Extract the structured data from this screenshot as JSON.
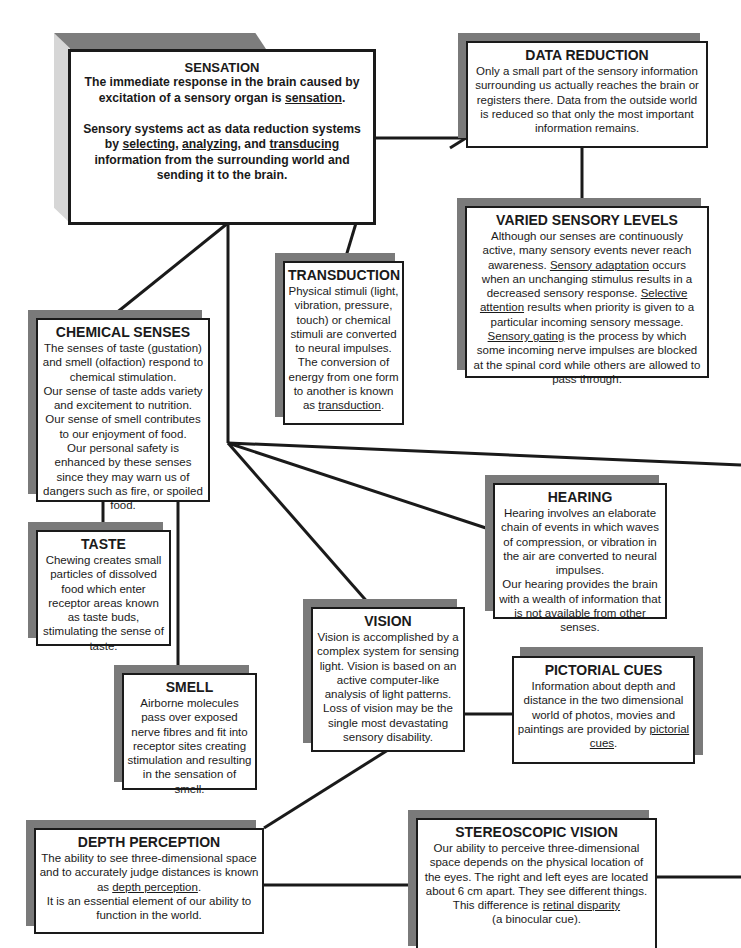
{
  "diagram": {
    "nodes": {
      "sensation": {
        "title": "SENSATION",
        "line1": "The immediate response in the brain caused by excitation of a sensory organ is ",
        "term1": "sensation",
        "line1_end": ".",
        "line2_a": "Sensory systems act as data reduction systems by ",
        "term2": "selecting",
        "sep1": ", ",
        "term3": "analyzing",
        "sep2": ", and ",
        "term4": "transducing",
        "line2_b": " information from the surrounding world and sending it to the brain."
      },
      "data_reduction": {
        "title": "DATA REDUCTION",
        "text": "Only a small part of the sensory information surrounding us actually reaches the brain or registers there.  Data from the outside world is reduced so that only the most important information remains."
      },
      "varied_sensory_levels": {
        "title": "VARIED SENSORY LEVELS",
        "intro": "Although our senses are continuously active, many sensory events never reach awareness.",
        "term1": "Sensory adaptation",
        "text1": " occurs when an unchanging stimulus results in a decreased sensory response.",
        "term2": "Selective attention",
        "text2": " results when priority is given to a particular incoming sensory message.",
        "term3": "Sensory gating",
        "text3": " is the process by which some incoming nerve impulses are blocked at the spinal cord while others are allowed to pass through."
      },
      "transduction": {
        "title": "TRANSDUCTION",
        "text": "Physical stimuli (light, vibration, pressure, touch) or chemical stimuli are converted to neural impulses. The conversion of energy from one form to another is known as ",
        "term": "transduction",
        "end": "."
      },
      "chemical_senses": {
        "title": "CHEMICAL SENSES",
        "p1": "The senses of taste (gustation) and smell (olfaction) respond to chemical stimulation.",
        "p2": "Our sense of taste adds variety and excitement to nutrition.",
        "p3": "Our sense of smell contributes to our enjoyment of food.",
        "p4": "Our personal safety is enhanced by these senses since they may warn us of dangers such as fire, or spoiled food."
      },
      "taste": {
        "title": "TASTE",
        "text": "Chewing creates small particles of dissolved food which enter receptor areas known as taste buds, stimulating the sense of taste."
      },
      "smell": {
        "title": "SMELL",
        "text": "Airborne molecules pass over exposed nerve fibres and fit into receptor sites creating stimulation and resulting in the sensation of smell."
      },
      "hearing": {
        "title": "HEARING",
        "p1": "Hearing involves an elaborate chain of events in which waves of compression, or vibration in the air are converted to neural impulses.",
        "p2": "Our hearing provides the brain with a wealth of information that is not available from other senses."
      },
      "vision": {
        "title": "VISION",
        "p1": "Vision is accomplished by a complex system for sensing light. Vision is based on an active computer-like analysis of light patterns.",
        "p2": "Loss of vision may be the single most devastating sensory disability."
      },
      "pictorial_cues": {
        "title": "PICTORIAL CUES",
        "text": "Information about depth and distance in the two dimensional world of photos, movies and paintings are provided by ",
        "term": "pictorial cues",
        "end": "."
      },
      "depth_perception": {
        "title": "DEPTH PERCEPTION",
        "text": "The ability to see three-dimensional space and to accurately judge distances is known as ",
        "term": "depth perception",
        "end": ".",
        "p2": "It is an essential element of our ability to function in the world."
      },
      "stereoscopic_vision": {
        "title": "STEREOSCOPIC VISION",
        "text": "Our ability to perceive three-dimensional space depends on the physical location of the eyes. The right and left eyes are located about 6 cm apart. They see different things. This difference is ",
        "term": "retinal disparity",
        "p2": "(a binocular cue)."
      }
    },
    "colors": {
      "line": "#1a1a1a",
      "shadow": "#7a7a7a",
      "box_fill": "#ffffff"
    }
  }
}
